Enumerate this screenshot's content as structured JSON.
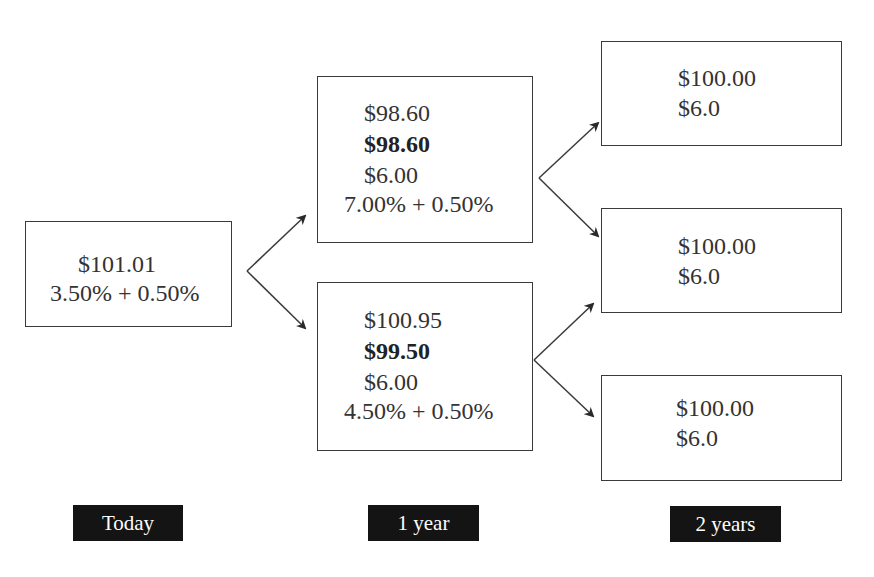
{
  "nodes": {
    "today": {
      "price": "$101.01",
      "rate": "3.50% + 0.50%"
    },
    "year1_up": {
      "price": "$98.60",
      "value": "$98.60",
      "coupon": "$6.00",
      "rate": "7.00% + 0.50%"
    },
    "year1_down": {
      "price": "$100.95",
      "value": "$99.50",
      "coupon": "$6.00",
      "rate": "4.50% + 0.50%"
    },
    "year2_uu": {
      "price": "$100.00",
      "coupon": "$6.0"
    },
    "year2_ud": {
      "price": "$100.00",
      "coupon": "$6.0"
    },
    "year2_dd": {
      "price": "$100.00",
      "coupon": "$6.0"
    }
  },
  "time_labels": {
    "today": "Today",
    "year1": "1 year",
    "year2": "2 years"
  },
  "colors": {
    "border": "#3a3a3a",
    "label_bg": "#141414",
    "label_text": "#ffffff",
    "text": "#333333"
  }
}
